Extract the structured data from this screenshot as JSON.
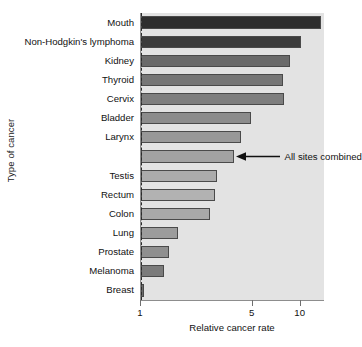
{
  "chart_data": {
    "type": "bar",
    "orientation": "horizontal",
    "title": "",
    "xlabel": "Relative cancer rate",
    "ylabel": "Type of cancer",
    "xscale": "log",
    "xlim": [
      1,
      14.2
    ],
    "xticks": [
      1,
      5,
      10
    ],
    "xticklabels": [
      "1",
      "5",
      "10"
    ],
    "grid": false,
    "legend": null,
    "reference_line": {
      "value": 1,
      "style": "dashed",
      "color": "#2b2b2b"
    },
    "categories": [
      "Mouth",
      "Non-Hodgkin's lymphoma",
      "Kidney",
      "Thyroid",
      "Cervix",
      "Bladder",
      "Larynx",
      "",
      "Testis",
      "Rectum",
      "Colon",
      "Lung",
      "Prostate",
      "Melanoma",
      "Breast"
    ],
    "values": [
      13.5,
      10.0,
      8.6,
      7.8,
      7.9,
      4.9,
      4.2,
      3.8,
      3.0,
      2.9,
      2.7,
      1.7,
      1.5,
      1.4,
      1.05
    ],
    "bar_colors": [
      "#2e2e2e",
      "#3c3c3c",
      "#6a6a6a",
      "#767676",
      "#7e7e7e",
      "#8c8c8c",
      "#989898",
      "#a2a2a2",
      "#ababab",
      "#b2b2b2",
      "#a9a9a9",
      "#9c9c9c",
      "#8f8f8f",
      "#7b7b7b",
      "#6d6d6d"
    ],
    "annotations": [
      {
        "text": "All sites combined",
        "points_to_category_index": 7,
        "points_to_value": 3.8,
        "arrow": "left-pointing"
      }
    ],
    "plot_background": "#e3e3e3"
  },
  "axis": {
    "y_title": "Type of cancer",
    "x_title": "Relative cancer rate"
  }
}
